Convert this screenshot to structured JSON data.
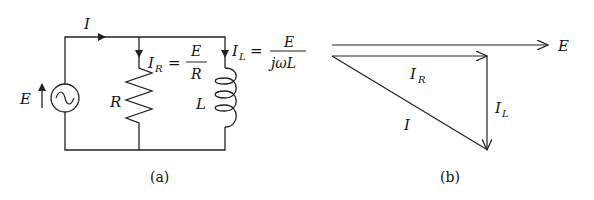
{
  "figure": {
    "panel_a": {
      "caption": "(a)",
      "source_label": "E",
      "total_current_label": "I",
      "resistor_label": "R",
      "inductor_label": "L",
      "ir_label": "I",
      "ir_sub": "R",
      "ir_eq": "=",
      "ir_num": "E",
      "ir_den": "R",
      "il_label": "I",
      "il_sub": "L",
      "il_eq": "=",
      "il_num": "E",
      "il_den": "jωL"
    },
    "panel_b": {
      "caption": "(b)",
      "e_label": "E",
      "ir_label": "I",
      "ir_sub": "R",
      "il_label": "I",
      "il_sub": "L",
      "i_label": "I"
    },
    "colors": {
      "ink": "#222222",
      "background": "#ffffff"
    }
  }
}
